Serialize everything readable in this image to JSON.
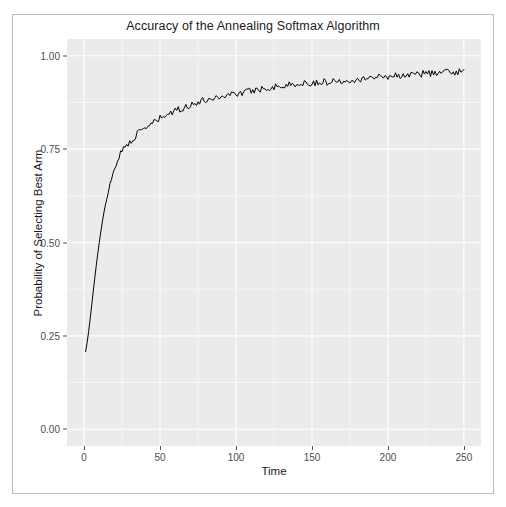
{
  "chart_data": {
    "type": "line",
    "title": "Accuracy of the Annealing Softmax Algorithm",
    "xlabel": "Time",
    "ylabel": "Probability of Selecting Best Arm",
    "xlim": [
      0,
      250
    ],
    "ylim": [
      0.0,
      1.0
    ],
    "xticks": [
      0,
      50,
      100,
      150,
      200,
      250
    ],
    "xtick_labels": [
      "0",
      "50",
      "100",
      "150",
      "200",
      "250"
    ],
    "yticks": [
      0.0,
      0.25,
      0.5,
      0.75,
      1.0
    ],
    "ytick_labels": [
      "0.00",
      "0.25",
      "0.50",
      "0.75",
      "1.00"
    ],
    "grid": true,
    "legend": "none",
    "panel_background": "#ebebeb",
    "grid_color": "#ffffff",
    "line_color": "#000000",
    "line_width": 1.0,
    "series": [
      {
        "name": "Probability of Selecting Best Arm",
        "x": [
          1,
          2,
          3,
          4,
          5,
          6,
          7,
          8,
          9,
          10,
          11,
          12,
          13,
          14,
          15,
          16,
          17,
          18,
          19,
          20,
          21,
          22,
          23,
          24,
          25,
          26,
          27,
          28,
          29,
          30,
          32,
          34,
          36,
          38,
          40,
          42,
          44,
          46,
          48,
          50,
          53,
          56,
          59,
          62,
          65,
          68,
          71,
          74,
          77,
          80,
          84,
          88,
          92,
          96,
          100,
          104,
          108,
          112,
          116,
          120,
          125,
          130,
          135,
          140,
          145,
          150,
          155,
          160,
          165,
          170,
          175,
          180,
          185,
          190,
          195,
          200,
          205,
          210,
          215,
          220,
          225,
          230,
          235,
          240,
          245,
          250
        ],
        "y": [
          0.208,
          0.232,
          0.262,
          0.296,
          0.332,
          0.368,
          0.404,
          0.438,
          0.47,
          0.5,
          0.528,
          0.554,
          0.578,
          0.6,
          0.62,
          0.638,
          0.655,
          0.67,
          0.684,
          0.697,
          0.709,
          0.72,
          0.73,
          0.739,
          0.747,
          0.752,
          0.755,
          0.759,
          0.764,
          0.77,
          0.779,
          0.786,
          0.793,
          0.799,
          0.805,
          0.812,
          0.817,
          0.821,
          0.826,
          0.832,
          0.838,
          0.845,
          0.849,
          0.856,
          0.86,
          0.866,
          0.87,
          0.874,
          0.878,
          0.882,
          0.886,
          0.89,
          0.893,
          0.897,
          0.9,
          0.9,
          0.905,
          0.908,
          0.911,
          0.914,
          0.917,
          0.919,
          0.922,
          0.924,
          0.926,
          0.928,
          0.929,
          0.93,
          0.932,
          0.934,
          0.936,
          0.938,
          0.94,
          0.942,
          0.944,
          0.946,
          0.947,
          0.948,
          0.95,
          0.951,
          0.953,
          0.954,
          0.955,
          0.956,
          0.957,
          0.958
        ]
      }
    ]
  }
}
